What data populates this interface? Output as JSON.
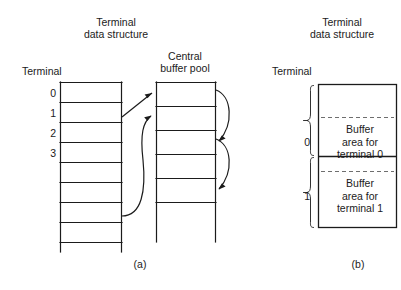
{
  "figure": {
    "panel_a": {
      "caption": "(a)",
      "title": "Terminal\ndata structure",
      "title_line1": "Terminal",
      "title_line2": "data structure",
      "terminal_label": "Terminal",
      "pool_title_line1": "Central",
      "pool_title_line2": "buffer pool",
      "row_numbers": [
        "0",
        "1",
        "2",
        "3"
      ],
      "terminal_table_rows": 8,
      "buffer_pool_rows": 5,
      "arrows": [
        {
          "name": "terminal-1-to-pool-slot-0",
          "type": "straight"
        },
        {
          "name": "terminal-3-to-pool-slot-1",
          "type": "curved"
        },
        {
          "name": "pool-slot-0-to-slot-2",
          "type": "curved-loop"
        },
        {
          "name": "pool-slot-2-to-slot-4",
          "type": "curved-loop"
        }
      ]
    },
    "panel_b": {
      "caption": "(b)",
      "title_line1": "Terminal",
      "title_line2": "data structure",
      "terminal_label": "Terminal",
      "sections": [
        {
          "index": "0",
          "text_line1": "Buffer",
          "text_line2": "area for",
          "text_line3": "terminal 0"
        },
        {
          "index": "1",
          "text_line1": "Buffer",
          "text_line2": "area for",
          "text_line3": "terminal 1"
        }
      ]
    }
  },
  "colors": {
    "background": "#ffffff",
    "stroke": "#1b1b1b",
    "dashed": "#6e6e6e",
    "text": "#1b1b1b"
  }
}
